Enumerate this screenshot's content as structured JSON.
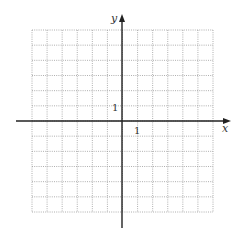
{
  "chart_data": {
    "type": "scatter",
    "title": "",
    "xlabel": "x",
    "ylabel": "y",
    "xlim": [
      -6,
      6
    ],
    "ylim": [
      -6,
      6
    ],
    "grid": true,
    "grid_style": "dotted",
    "grid_step": 1,
    "tick_labels": {
      "x": [
        "1"
      ],
      "y": [
        "1"
      ]
    },
    "series": [],
    "legend": null
  },
  "labels": {
    "x_axis": "x",
    "y_axis": "y",
    "x_unit_tick": "1",
    "y_unit_tick": "1"
  },
  "colors": {
    "axis": "#222222",
    "grid": "#9a9a9a",
    "background": "#ffffff"
  }
}
